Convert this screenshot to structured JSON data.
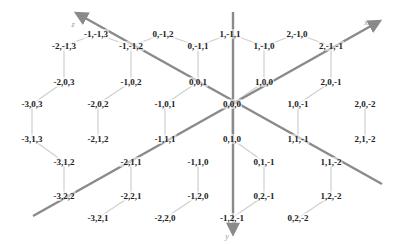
{
  "diagram": {
    "type": "hexagonal-cube-coordinates",
    "colors": {
      "edge": "#cfcfcf",
      "axis": "#8a8a8a",
      "label": "#222222",
      "axis_label": "#9a9a9a"
    },
    "axes": [
      {
        "name": "x",
        "label": "x",
        "from": [
          33,
          216
        ],
        "to": [
          378,
          22
        ],
        "label_pos": [
          366,
          22
        ]
      },
      {
        "name": "y",
        "label": "y",
        "from": [
          233,
          12
        ],
        "to": [
          233,
          232
        ],
        "label_pos": [
          227,
          236
        ]
      },
      {
        "name": "z",
        "label": "z",
        "from": [
          382,
          184
        ],
        "to": [
          78,
          14
        ],
        "label_pos": [
          73,
          24
        ]
      }
    ],
    "nodes": [
      {
        "label": "-1,-1,3",
        "x": 96,
        "y": 34
      },
      {
        "label": "0,-1,2",
        "x": 163,
        "y": 34
      },
      {
        "label": "1,-1,1",
        "x": 230,
        "y": 34
      },
      {
        "label": "2,-1,0",
        "x": 297,
        "y": 34
      },
      {
        "label": "-2,-1,3",
        "x": 64,
        "y": 46
      },
      {
        "label": "-1,-1,2",
        "x": 131,
        "y": 46
      },
      {
        "label": "0,-1,1",
        "x": 198,
        "y": 46
      },
      {
        "label": "1,-1,0",
        "x": 264,
        "y": 46
      },
      {
        "label": "2,-1,-1",
        "x": 331,
        "y": 46
      },
      {
        "label": "-2,0,3",
        "x": 64,
        "y": 82
      },
      {
        "label": "-1,0,2",
        "x": 131,
        "y": 82
      },
      {
        "label": "0,0,1",
        "x": 198,
        "y": 82
      },
      {
        "label": "1,0,0",
        "x": 264,
        "y": 82
      },
      {
        "label": "2,0,-1",
        "x": 331,
        "y": 82
      },
      {
        "label": "-3,0,3",
        "x": 32,
        "y": 104
      },
      {
        "label": "-2,0,2",
        "x": 98,
        "y": 104
      },
      {
        "label": "-1,0,1",
        "x": 165,
        "y": 104
      },
      {
        "label": "0,0,0",
        "x": 232,
        "y": 104
      },
      {
        "label": "1,0,-1",
        "x": 298,
        "y": 104
      },
      {
        "label": "2,0,-2",
        "x": 365,
        "y": 104
      },
      {
        "label": "-3,1,3",
        "x": 32,
        "y": 139
      },
      {
        "label": "-2,1,2",
        "x": 98,
        "y": 139
      },
      {
        "label": "-1,1,1",
        "x": 165,
        "y": 139
      },
      {
        "label": "0,1,0",
        "x": 232,
        "y": 139
      },
      {
        "label": "1,1,-1",
        "x": 298,
        "y": 139
      },
      {
        "label": "2,1,-2",
        "x": 365,
        "y": 139
      },
      {
        "label": "-3,1,2",
        "x": 64,
        "y": 162
      },
      {
        "label": "-2,1,1",
        "x": 131,
        "y": 162
      },
      {
        "label": "-1,1,0",
        "x": 198,
        "y": 162
      },
      {
        "label": "0,1,-1",
        "x": 264,
        "y": 162
      },
      {
        "label": "1,1,-2",
        "x": 331,
        "y": 162
      },
      {
        "label": "-3,2,2",
        "x": 64,
        "y": 196
      },
      {
        "label": "-2,2,1",
        "x": 131,
        "y": 196
      },
      {
        "label": "-1,2,0",
        "x": 198,
        "y": 196
      },
      {
        "label": "0,2,-1",
        "x": 264,
        "y": 196
      },
      {
        "label": "1,2,-2",
        "x": 331,
        "y": 196
      },
      {
        "label": "-3,2,1",
        "x": 98,
        "y": 218
      },
      {
        "label": "-2,2,0",
        "x": 165,
        "y": 218
      },
      {
        "label": "-1,2,-1",
        "x": 232,
        "y": 218
      },
      {
        "label": "0,2,-2",
        "x": 298,
        "y": 218
      }
    ]
  }
}
